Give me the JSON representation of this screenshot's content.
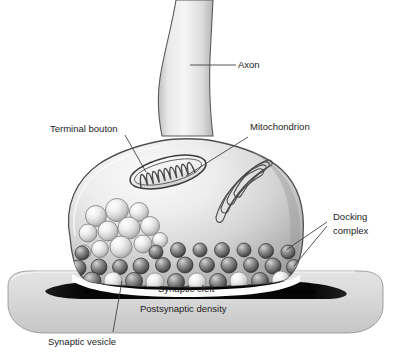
{
  "figure": {
    "background_color": "#ffffff",
    "ink_color": "#1d1d1d",
    "style": "grayscale airbrush anatomical illustration"
  },
  "labels": {
    "axon": "Axon",
    "terminal_bouton": "Terminal bouton",
    "mitochondrion": "Mitochondrion",
    "docking_complex_line1": "Docking",
    "docking_complex_line2": "complex",
    "synaptic_cleft": "Synaptic cleft",
    "postsynaptic_density": "Postsynaptic density",
    "synaptic_vesicle": "Synaptic vesicle"
  },
  "structures": {
    "axon_name": "axon",
    "bouton_name": "terminal-bouton",
    "mitochondrion_name": "mitochondrion",
    "golgi_name": "golgi-apparatus",
    "vesicle_cluster_name": "synaptic-vesicle-cluster",
    "docking_row_name": "docking-complex-row",
    "cleft_name": "synaptic-cleft",
    "postsynaptic_cell_name": "postsynaptic-cell",
    "density_band_name": "postsynaptic-density-band"
  },
  "colors": {
    "outline": "#4a4a4a",
    "cell_light": "#f4f4f4",
    "cell_mid": "#d2d2d2",
    "cell_dark": "#a8a8a8",
    "vesicle_light": "#fbfbfb",
    "vesicle_shade": "#b9b9b9",
    "docking_dark": "#6e6e6e",
    "docking_shade": "#3c3c3c",
    "density_black": "#0b0b0b",
    "slab_gray": "#d9d9d9"
  },
  "counts": {
    "free_vesicles": 12,
    "docking_spheres": 34,
    "golgi_cisternae": 4,
    "mitochondrion_cristae": 9
  }
}
